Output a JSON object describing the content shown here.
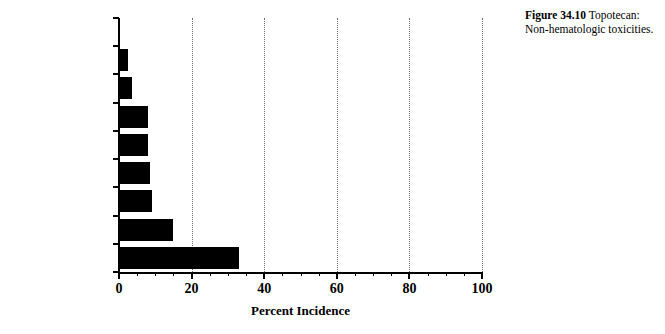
{
  "caption": {
    "figure_number": "Figure 34.10",
    "text": "Topotecan: Non-hematologic toxicities."
  },
  "chart_data": {
    "type": "bar",
    "orientation": "horizontal",
    "title": "",
    "subtitle": "",
    "xlabel": "Percent Incidence",
    "ylabel": "",
    "categories": [
      "Fever",
      "Transaminasemia",
      "Fatigue",
      "Vomiting",
      "Diarrhea",
      "Stomatitis",
      "Anorexia",
      "Alopecia",
      "Nausea"
    ],
    "values": [
      0,
      2.5,
      3.5,
      8,
      8,
      8.5,
      9,
      15,
      33
    ],
    "xlim": [
      0,
      100
    ],
    "xticks": [
      0,
      20,
      40,
      60,
      80,
      100
    ],
    "xticklabels": [
      "0",
      "20",
      "40",
      "60",
      "80",
      "100"
    ],
    "minor_tick_interval": 5,
    "grid": "vertical-dotted",
    "legend": "none",
    "bar_color": "#000000",
    "grid_color": "#6b6b6b",
    "axis_color": "#000000"
  }
}
